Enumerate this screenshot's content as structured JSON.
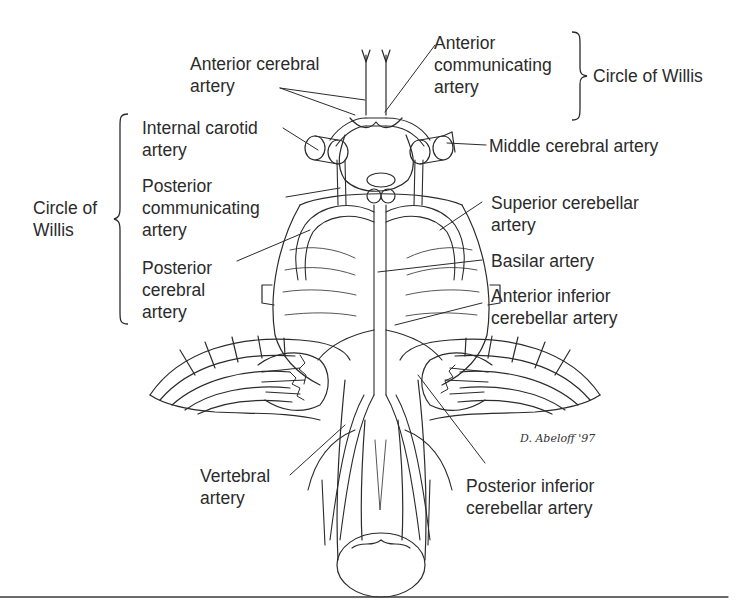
{
  "diagram": {
    "signature": "D. Abeloff '97",
    "colors": {
      "background": "#ffffff",
      "ink": "#2b2b2b",
      "rule": "#3a3a3a"
    },
    "group_labels": {
      "circle_of_willis_left": [
        "Circle of",
        "Willis"
      ],
      "circle_of_willis_right": "Circle of Willis"
    },
    "labels": {
      "anterior_cerebral": [
        "Anterior cerebral",
        "artery"
      ],
      "anterior_communicating": [
        "Anterior",
        "communicating",
        "artery"
      ],
      "internal_carotid": [
        "Internal carotid",
        "artery"
      ],
      "middle_cerebral": [
        "Middle cerebral artery"
      ],
      "posterior_communicating": [
        "Posterior",
        "communicating",
        "artery"
      ],
      "superior_cerebellar": [
        "Superior cerebellar",
        "artery"
      ],
      "basilar": [
        "Basilar artery"
      ],
      "posterior_cerebral": [
        "Posterior",
        "cerebral",
        "artery"
      ],
      "anterior_inferior_cerebellar": [
        "Anterior inferior",
        "cerebellar artery"
      ],
      "vertebral": [
        "Vertebral",
        "artery"
      ],
      "posterior_inferior_cerebellar": [
        "Posterior inferior",
        "cerebellar artery"
      ]
    }
  }
}
